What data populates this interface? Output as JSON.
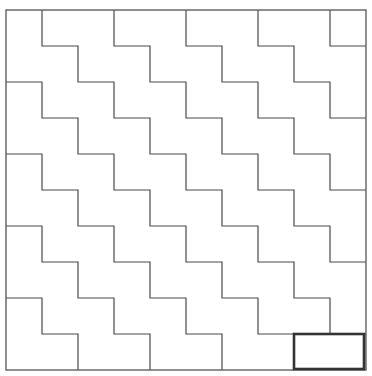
{
  "diagram": {
    "grid": {
      "columns": 10,
      "rows": 10
    },
    "staircases_from_top_edge": [
      1,
      3,
      5,
      7,
      9
    ],
    "staircases_from_left_edge": [
      2,
      4,
      6,
      8
    ],
    "highlighted_domino": {
      "col_start": 8,
      "col_end": 10,
      "row_start": 9,
      "row_end": 10
    },
    "colors": {
      "background": "#ffffff",
      "line": "#4a4a4a",
      "highlight": "#333333"
    }
  }
}
